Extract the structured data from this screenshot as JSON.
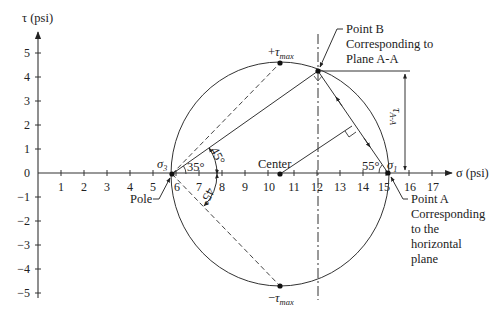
{
  "diagram": {
    "type": "Mohr's circle",
    "axes": {
      "x_label": "σ (psi)",
      "y_label": "τ (psi)",
      "x_ticks": [
        "1",
        "2",
        "3",
        "4",
        "5",
        "6",
        "7",
        "8",
        "9",
        "10",
        "11",
        "12",
        "13",
        "14",
        "15",
        "16",
        "17"
      ],
      "y_ticks_pos": [
        "5",
        "4",
        "3",
        "2",
        "1"
      ],
      "y_tick_zero": "0",
      "y_ticks_neg": [
        "−1",
        "−2",
        "−3",
        "−4",
        "−5"
      ]
    },
    "labels": {
      "tau_max_pos_sign": "+",
      "tau_max_neg_sign": "−",
      "tau_symbol": "τ",
      "max_subscript": "max",
      "sigma_symbol": "σ",
      "sigma3_sub": "3",
      "sigma1_sub": "1",
      "center": "Center",
      "pole": "Pole",
      "angle_35": "35°",
      "angle_45_upper": "45°",
      "angle_45_lower": "45°",
      "angle_55": "55°",
      "tau_aa_symbol": "τ",
      "tau_aa_sub": "A-A",
      "point_b_line1": "Point B",
      "point_b_line2": "Corresponding to",
      "point_b_line3": "Plane A-A",
      "point_a_line1": "Point A",
      "point_a_line2": "Corresponding",
      "point_a_line3": "to the",
      "point_a_line4": "horizontal",
      "point_a_line5": "plane"
    },
    "values": {
      "center_sigma": 10.5,
      "sigma_3": 5.8,
      "sigma_1": 15.0,
      "tau_max": 4.6,
      "point_B": {
        "sigma": 12.2,
        "tau": 4.25
      },
      "point_A": {
        "sigma": 15.0,
        "tau": 0
      },
      "pole": {
        "sigma": 5.8,
        "tau": 0
      }
    },
    "colors": {
      "line": "#333333",
      "background": "#ffffff"
    }
  }
}
